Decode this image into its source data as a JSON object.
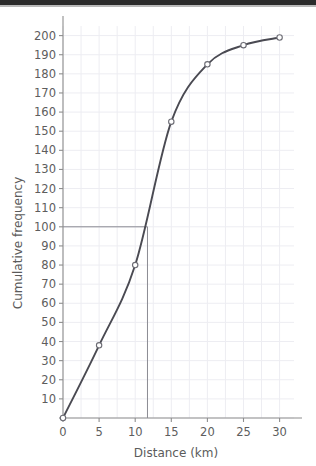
{
  "chart_data": {
    "type": "line",
    "title": "",
    "xlabel": "Distance (km)",
    "ylabel": "Cumulative frequency",
    "xlim": [
      0,
      32
    ],
    "ylim": [
      0,
      205
    ],
    "grid": true,
    "legend": "none",
    "x": [
      0,
      5,
      10,
      15,
      20,
      25,
      30
    ],
    "values": [
      0,
      38,
      80,
      155,
      185,
      195,
      199
    ],
    "series": [
      {
        "name": "Cumulative frequency",
        "x": [
          0,
          5,
          10,
          15,
          20,
          25,
          30
        ],
        "values": [
          0,
          38,
          80,
          155,
          185,
          195,
          199
        ]
      }
    ],
    "x_ticks": [
      0,
      5,
      10,
      15,
      20,
      25,
      30
    ],
    "x_tick_labels": [
      "0",
      "5",
      "10",
      "15",
      "20",
      "25",
      "30"
    ],
    "y_ticks": [
      0,
      10,
      20,
      30,
      40,
      50,
      60,
      70,
      80,
      90,
      100,
      110,
      120,
      130,
      140,
      150,
      160,
      170,
      180,
      190,
      200
    ],
    "y_tick_labels": [
      "0",
      "10",
      "20",
      "30",
      "40",
      "50",
      "60",
      "70",
      "80",
      "90",
      "100",
      "110",
      "120",
      "130",
      "140",
      "150",
      "160",
      "170",
      "180",
      "190",
      "200"
    ],
    "annotations": [
      {
        "name": "median-reference",
        "type": "crosshair",
        "y_value": 100,
        "x_value": 11.7,
        "description": "horizontal line from y-axis at cumulative frequency 100 to the curve, then vertical line down to the distance axis"
      }
    ],
    "colors": {
      "curve": "#4a4a52",
      "marker_fill": "#ffffff",
      "marker_stroke": "#6c6c74",
      "axis": "#8e8e8e",
      "grid": "#ededf2",
      "text": "#5d5d5d",
      "background": "#ffffff",
      "top_band": "#2b2b2b"
    }
  }
}
